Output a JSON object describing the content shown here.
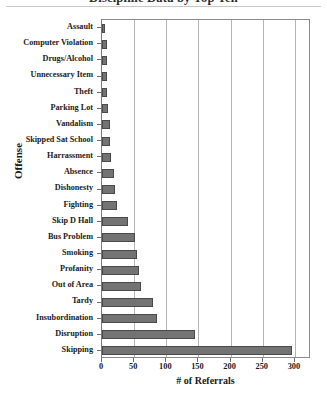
{
  "chart_data": {
    "type": "bar",
    "orientation": "horizontal",
    "title": "Discipline Data by Top Ten",
    "xlabel": "# of Referrals",
    "ylabel": "Offense",
    "xlim": [
      0,
      325
    ],
    "xticks": [
      0,
      50,
      100,
      150,
      200,
      250,
      300
    ],
    "xtick_labels": [
      "0",
      "50",
      "100",
      "150",
      "200",
      "250",
      "300"
    ],
    "grid": true,
    "legend": "none",
    "bar_color": "#737373",
    "bar_edge_color": "#4a4a4a",
    "categories": [
      "Assault",
      "Computer Violation",
      "Drugs/Alcohol",
      "Unnecessary Item",
      "Theft",
      "Parking Lot",
      "Vandalism",
      "Skipped Sat School",
      "Harrassment",
      "Absence",
      "Dishonesty",
      "Fighting",
      "Skip D Hall",
      "Bus Problem",
      "Smoking",
      "Profanity",
      "Out of Area",
      "Tardy",
      "Insubordination",
      "Disruption",
      "Skipping"
    ],
    "values": [
      5,
      8,
      8,
      8,
      8,
      10,
      12,
      12,
      14,
      18,
      20,
      24,
      40,
      52,
      55,
      58,
      60,
      80,
      85,
      145,
      295
    ]
  }
}
